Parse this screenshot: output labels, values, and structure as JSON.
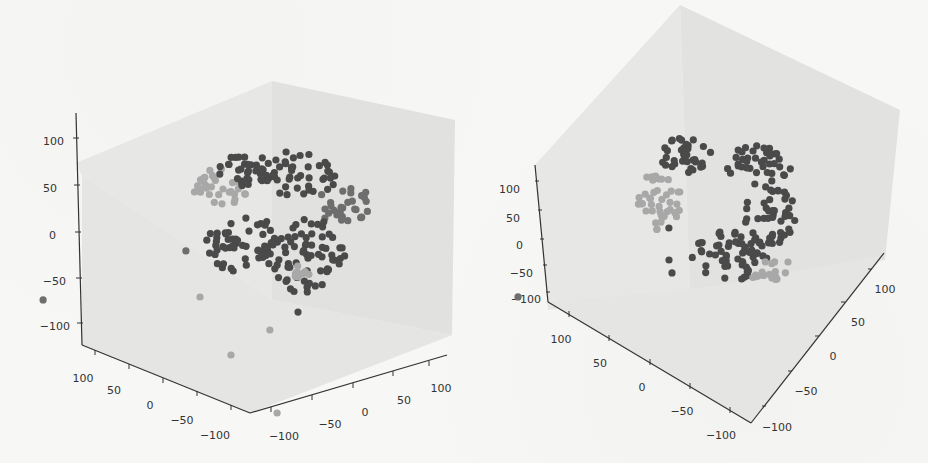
{
  "chart_data": [
    {
      "type": "scatter",
      "subtype": "scatter3d",
      "title": "",
      "xlabel": "",
      "ylabel": "",
      "zlabel": "",
      "x_ticks": [
        "100",
        "50",
        "0",
        "-50",
        "-100"
      ],
      "y_ticks": [
        "-100",
        "-50",
        "0",
        "50",
        "100"
      ],
      "z_ticks": [
        "100",
        "50",
        "0",
        "-50",
        "-100"
      ],
      "xlim": [
        -100,
        100
      ],
      "ylim": [
        -100,
        100
      ],
      "zlim": [
        -100,
        100
      ],
      "grid": false,
      "legend": null,
      "series": [
        {
          "name": "dark cluster",
          "color": "#4a4a4a",
          "approx_points": 300
        },
        {
          "name": "light cluster",
          "color": "#a8a8a8",
          "approx_points": 60
        }
      ],
      "notes": "Roughly spherical point cloud centered near origin with a lighter sub-cluster in upper-left; a few outliers below (z about -75 to -110)."
    },
    {
      "type": "scatter",
      "subtype": "scatter3d",
      "title": "",
      "xlabel": "",
      "ylabel": "",
      "zlabel": "",
      "x_ticks": [
        "100",
        "50",
        "0",
        "-50",
        "-100"
      ],
      "y_ticks": [
        "-100",
        "-50",
        "0",
        "50",
        "100"
      ],
      "z_ticks": [
        "100",
        "50",
        "0",
        "-50",
        "-100"
      ],
      "xlim": [
        -100,
        100
      ],
      "ylim": [
        -100,
        100
      ],
      "zlim": [
        -100,
        100
      ],
      "grid": false,
      "legend": null,
      "series": [
        {
          "name": "dark cluster",
          "color": "#4a4a4a",
          "approx_points": 300
        },
        {
          "name": "light cluster",
          "color": "#a8a8a8",
          "approx_points": 60
        }
      ],
      "notes": "Same point cloud viewed from a different elevation/azimuth; light sub-cluster on the left side."
    }
  ],
  "plots": {
    "left": {
      "z_ticks": [
        "100",
        "50",
        "0",
        "-50",
        "-100"
      ],
      "x_ticks": [
        "100",
        "50",
        "0",
        "-50",
        "-100"
      ],
      "y_ticks": [
        "-100",
        "-50",
        "0",
        "50",
        "100"
      ]
    },
    "right": {
      "z_ticks": [
        "100",
        "50",
        "0",
        "-50",
        "-100"
      ],
      "x_ticks": [
        "100",
        "50",
        "0",
        "-50",
        "-100"
      ],
      "y_ticks": [
        "-100",
        "-50",
        "0",
        "50",
        "100"
      ]
    }
  },
  "colors": {
    "dark_point": "#4a4a4a",
    "mid_point": "#6e6e6e",
    "light_point": "#a8a8a8",
    "pane": "#e6e6e4",
    "pane_dark": "#dcdcda",
    "axis": "#333333"
  }
}
